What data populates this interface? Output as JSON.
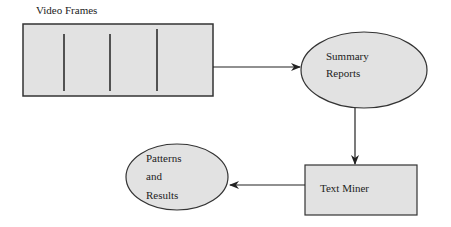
{
  "diagram": {
    "title": "Video Frames",
    "nodes": {
      "video_frames": {
        "label": "Video Frames",
        "shape": "rectangle",
        "frame_dividers": 3
      },
      "summary_reports": {
        "label_line1": "Summary",
        "label_line2": "Reports",
        "shape": "ellipse"
      },
      "text_miner": {
        "label": "Text Miner",
        "shape": "rectangle"
      },
      "patterns_results": {
        "label_line1": "Patterns",
        "label_line2": "and",
        "label_line3": "Results",
        "shape": "ellipse"
      }
    },
    "edges": [
      {
        "from": "Video Frames",
        "to": "Summary Reports"
      },
      {
        "from": "Summary Reports",
        "to": "Text Miner"
      },
      {
        "from": "Text Miner",
        "to": "Patterns and Results"
      }
    ],
    "colors": {
      "fill": "#e2e2e2",
      "stroke": "#333333",
      "text": "#222222"
    }
  }
}
